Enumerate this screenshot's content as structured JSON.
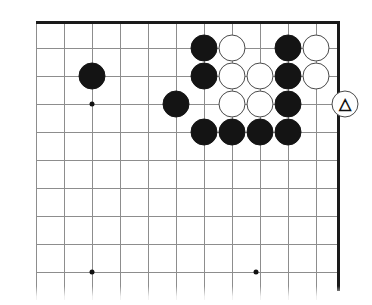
{
  "figure": {
    "kind": "go-board-diagram",
    "board_size": 19,
    "view": "upper-right corner, partial board",
    "colors": {
      "grid_line": "#8d8d8d",
      "edge_line": "#1a1a1a",
      "black_stone": "#141414",
      "white_stone": "#ffffff",
      "white_stone_outline": "#4a4a4a",
      "background": "#ffffff"
    },
    "geometry": {
      "cell": 28,
      "stone_diameter": 27,
      "origin_x": 36,
      "origin_y": 21,
      "columns_px": [
        36,
        64,
        92,
        120,
        148,
        176,
        204,
        232,
        260,
        288,
        316
      ],
      "rows_px": [
        21,
        48,
        76,
        104,
        132,
        160,
        188,
        216,
        244,
        272
      ],
      "right_edge_px": 338,
      "top_edge_px": 21
    }
  },
  "grid": {
    "vertical_lines_px": [
      36,
      64,
      92,
      120,
      148,
      176,
      204,
      232,
      260,
      288,
      316
    ],
    "horizontal_lines_px": [
      48,
      76,
      104,
      132,
      160,
      188,
      216,
      244,
      272
    ],
    "top_edge": {
      "x": 36,
      "y": 21,
      "width": 304
    },
    "right_edge": {
      "x": 337,
      "y": 21,
      "height": 270
    }
  },
  "star_points": [
    {
      "name": "hoshi-upper-left",
      "x": 92,
      "y": 104
    },
    {
      "name": "hoshi-lower-left",
      "x": 92,
      "y": 272
    },
    {
      "name": "hoshi-lower-right",
      "x": 256,
      "y": 272
    }
  ],
  "stones": [
    {
      "id": "b1",
      "color": "black",
      "x": 92,
      "y": 76,
      "mark": ""
    },
    {
      "id": "b2",
      "color": "black",
      "x": 176,
      "y": 104,
      "mark": ""
    },
    {
      "id": "b3",
      "color": "black",
      "x": 204,
      "y": 48,
      "mark": ""
    },
    {
      "id": "w1",
      "color": "white",
      "x": 232,
      "y": 48,
      "mark": ""
    },
    {
      "id": "b4",
      "color": "black",
      "x": 288,
      "y": 48,
      "mark": ""
    },
    {
      "id": "w2",
      "color": "white",
      "x": 316,
      "y": 48,
      "mark": ""
    },
    {
      "id": "b5",
      "color": "black",
      "x": 204,
      "y": 76,
      "mark": ""
    },
    {
      "id": "w3",
      "color": "white",
      "x": 232,
      "y": 76,
      "mark": ""
    },
    {
      "id": "w4",
      "color": "white",
      "x": 260,
      "y": 76,
      "mark": ""
    },
    {
      "id": "b6",
      "color": "black",
      "x": 288,
      "y": 76,
      "mark": ""
    },
    {
      "id": "w5",
      "color": "white",
      "x": 316,
      "y": 76,
      "mark": ""
    },
    {
      "id": "w6",
      "color": "white",
      "x": 232,
      "y": 104,
      "mark": ""
    },
    {
      "id": "w7",
      "color": "white",
      "x": 260,
      "y": 104,
      "mark": ""
    },
    {
      "id": "b7",
      "color": "black",
      "x": 288,
      "y": 104,
      "mark": ""
    },
    {
      "id": "b8",
      "color": "black",
      "x": 204,
      "y": 132,
      "mark": ""
    },
    {
      "id": "b9",
      "color": "black",
      "x": 232,
      "y": 132,
      "mark": ""
    },
    {
      "id": "b10",
      "color": "black",
      "x": 260,
      "y": 132,
      "mark": ""
    },
    {
      "id": "b11",
      "color": "black",
      "x": 288,
      "y": 132,
      "mark": ""
    },
    {
      "id": "wt",
      "color": "white",
      "x": 345,
      "y": 104,
      "mark": "triangle",
      "mark_glyph": "△",
      "off_board": true
    }
  ],
  "markers": {
    "triangle_label": "△",
    "triangle_meaning": "triangle-marked white stone"
  }
}
